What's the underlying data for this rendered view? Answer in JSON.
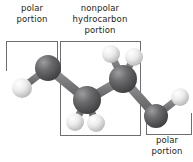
{
  "figure": {
    "labels": {
      "polar_left": "polar\nportion",
      "nonpolar": "nonpolar hydrocarbon\nportion",
      "polar_right": "polar\nportion"
    },
    "colors": {
      "background": "#ffffff",
      "text": "#231f20",
      "bracket": "#6d6e71",
      "carbon_dark": "#58585a",
      "carbon_highlight": "#8a8a8c",
      "hydrogen_light": "#e9e9e9",
      "hydrogen_highlight": "#ffffff",
      "bond": "#7a7a7c"
    },
    "brackets": [
      {
        "name": "polar-left",
        "open_side": "bottom"
      },
      {
        "name": "nonpolar-hydrocarbon",
        "open_side": "none"
      },
      {
        "name": "polar-right",
        "open_side": "top"
      }
    ],
    "molecule": {
      "atoms": [
        {
          "id": "h-left",
          "element": "H",
          "type": "light",
          "cx": 22,
          "cy": 88,
          "r": 10
        },
        {
          "id": "c1",
          "element": "C",
          "type": "dark",
          "cx": 48,
          "cy": 68,
          "r": 13
        },
        {
          "id": "c2",
          "element": "C",
          "type": "dark",
          "cx": 87,
          "cy": 100,
          "r": 14
        },
        {
          "id": "h-c2-a",
          "element": "H",
          "type": "light",
          "cx": 75,
          "cy": 122,
          "r": 9
        },
        {
          "id": "h-c2-b",
          "element": "H",
          "type": "light",
          "cx": 96,
          "cy": 123,
          "r": 9
        },
        {
          "id": "c3",
          "element": "C",
          "type": "dark",
          "cx": 123,
          "cy": 79,
          "r": 14
        },
        {
          "id": "h-c3-a",
          "element": "H",
          "type": "light",
          "cx": 111,
          "cy": 54,
          "r": 9
        },
        {
          "id": "h-c3-b",
          "element": "H",
          "type": "light",
          "cx": 134,
          "cy": 57,
          "r": 9
        },
        {
          "id": "c4",
          "element": "C",
          "type": "dark",
          "cx": 156,
          "cy": 116,
          "r": 12
        },
        {
          "id": "h-right",
          "element": "H",
          "type": "light",
          "cx": 180,
          "cy": 97,
          "r": 9
        }
      ],
      "bonds": [
        {
          "from": "h-left",
          "to": "c1"
        },
        {
          "from": "c1",
          "to": "c2"
        },
        {
          "from": "c2",
          "to": "h-c2-a"
        },
        {
          "from": "c2",
          "to": "h-c2-b"
        },
        {
          "from": "c2",
          "to": "c3"
        },
        {
          "from": "c3",
          "to": "h-c3-a"
        },
        {
          "from": "c3",
          "to": "h-c3-b"
        },
        {
          "from": "c3",
          "to": "c4"
        },
        {
          "from": "c4",
          "to": "h-right"
        }
      ]
    }
  }
}
